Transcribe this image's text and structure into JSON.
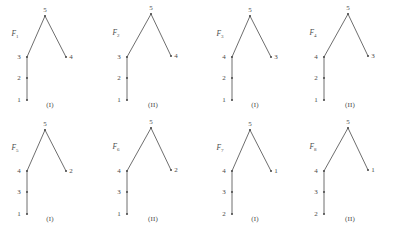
{
  "figure": {
    "kind": "tree-diagram-grid",
    "columns": 4,
    "rows": 2,
    "apex_node_label": "5",
    "panels": [
      {
        "id": "panel-1",
        "family_label": "F",
        "family_subscript": "1",
        "caption": "(I)",
        "variant": "I",
        "chain_labels": [
          "1",
          "2",
          "3"
        ],
        "branch_label": "3",
        "apex_label": "5",
        "leaf_label": "4",
        "left": 0,
        "top": 0
      },
      {
        "id": "panel-2",
        "family_label": "F",
        "family_subscript": "2",
        "caption": "(II)",
        "variant": "II",
        "chain_labels": [
          "1",
          "2",
          "3"
        ],
        "branch_label": "3",
        "apex_label": "5",
        "leaf_label": "4",
        "left": 103,
        "top": 0
      },
      {
        "id": "panel-3",
        "family_label": "F",
        "family_subscript": "3",
        "caption": "(I)",
        "variant": "I",
        "chain_labels": [
          "1",
          "2",
          "4"
        ],
        "branch_label": "4",
        "apex_label": "5",
        "leaf_label": "3",
        "left": 205,
        "top": 0
      },
      {
        "id": "panel-4",
        "family_label": "F",
        "family_subscript": "4",
        "caption": "(II)",
        "variant": "II",
        "chain_labels": [
          "1",
          "2",
          "4"
        ],
        "branch_label": "4",
        "apex_label": "5",
        "leaf_label": "3",
        "left": 300,
        "top": 0
      },
      {
        "id": "panel-5",
        "family_label": "F",
        "family_subscript": "5",
        "caption": "(I)",
        "variant": "I",
        "chain_labels": [
          "1",
          "3",
          "4"
        ],
        "branch_label": "4",
        "apex_label": "5",
        "leaf_label": "2",
        "left": 0,
        "top": 114
      },
      {
        "id": "panel-6",
        "family_label": "F",
        "family_subscript": "6",
        "caption": "(II)",
        "variant": "II",
        "chain_labels": [
          "1",
          "3",
          "4"
        ],
        "branch_label": "4",
        "apex_label": "5",
        "leaf_label": "2",
        "left": 103,
        "top": 114
      },
      {
        "id": "panel-7",
        "family_label": "F",
        "family_subscript": "7",
        "caption": "(I)",
        "variant": "I",
        "chain_labels": [
          "2",
          "3",
          "4"
        ],
        "branch_label": "4",
        "apex_label": "5",
        "leaf_label": "1",
        "left": 205,
        "top": 114
      },
      {
        "id": "panel-8",
        "family_label": "F",
        "family_subscript": "8",
        "caption": "(II)",
        "variant": "II",
        "chain_labels": [
          "2",
          "3",
          "4"
        ],
        "branch_label": "4",
        "apex_label": "5",
        "leaf_label": "1",
        "left": 300,
        "top": 114
      }
    ],
    "colors": {
      "background": "#ffffff",
      "edge": "#5e5e5e",
      "node": "#4f4f4f",
      "text": "#4a4a4a"
    }
  }
}
